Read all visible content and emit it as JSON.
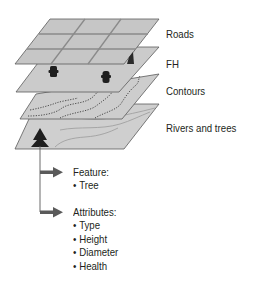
{
  "diagram": {
    "layers": [
      {
        "id": "roads",
        "label": "Roads"
      },
      {
        "id": "fh",
        "label": "FH"
      },
      {
        "id": "contours",
        "label": "Contours"
      },
      {
        "id": "rivers",
        "label": "Rivers and trees"
      }
    ],
    "feature": {
      "heading": "Feature:",
      "items": [
        "Tree"
      ]
    },
    "attributes": {
      "heading": "Attributes:",
      "items": [
        "Type",
        "Height",
        "Diameter",
        "Health"
      ]
    },
    "icons": {
      "hydrant": "fire-hydrant-icon",
      "tree": "tree-icon",
      "arrow": "arrow-right-icon"
    },
    "colors": {
      "plane_fill": "#c8c8c8",
      "plane_stroke": "#5a5a5a",
      "grid_lines": "#8a8a8a",
      "icon_fill": "#2a2a2a",
      "arrow": "#5a5a5a",
      "text": "#231f20"
    }
  }
}
